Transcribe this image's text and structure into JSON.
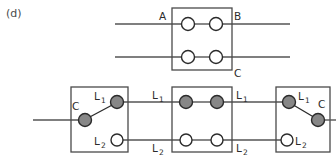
{
  "figure": {
    "caption": "(d)",
    "width": 336,
    "height": 156,
    "colors": {
      "background": "#ffffff",
      "wire": "#555555",
      "box_outline": "#4a4a4a",
      "terminal_filled": "#878787",
      "terminal_open": "#ffffff",
      "terminal_stroke": "#2b2b2b",
      "text": "#2b2b2b",
      "caption_text": "#4a4a4a"
    }
  },
  "top_assembly": {
    "name": "double-pole-switch",
    "box": {
      "x": 172,
      "y": 8,
      "width": 60,
      "height": 62
    },
    "labels": {
      "a": "A",
      "b": "B",
      "c": "C"
    },
    "rows": [
      {
        "name": "upper-pole",
        "y": 24,
        "left_wire_x1": 115,
        "right_wire_x2": 290,
        "terminals": [
          {
            "cx": 188,
            "cy": 24,
            "r": 6.5,
            "state": "open"
          },
          {
            "cx": 216,
            "cy": 24,
            "r": 6.5,
            "state": "open"
          }
        ]
      },
      {
        "name": "lower-pole",
        "y": 57,
        "left_wire_x1": 115,
        "right_wire_x2": 290,
        "terminals": [
          {
            "cx": 188,
            "cy": 57,
            "r": 6.5,
            "state": "open"
          },
          {
            "cx": 216,
            "cy": 57,
            "r": 6.5,
            "state": "open"
          }
        ]
      }
    ]
  },
  "bottom_assembly": {
    "name": "three-way-switch-chain",
    "rails": {
      "upper_label": "L1",
      "lower_label": "L2",
      "upper_y": 102,
      "lower_y": 140
    },
    "boxes": [
      {
        "name": "left-switch",
        "type": "three-way",
        "x": 71,
        "y": 87,
        "width": 57,
        "height": 65,
        "terminals": [
          {
            "name": "C",
            "cx": 85,
            "cy": 120,
            "r": 6.5,
            "state": "filled",
            "label": "C",
            "label_x": 77,
            "label_y": 106
          },
          {
            "name": "L1",
            "cx": 117,
            "cy": 102,
            "r": 6.5,
            "state": "filled",
            "label": "L1",
            "label_x": 97,
            "label_y": 101
          },
          {
            "name": "L2",
            "cx": 117,
            "cy": 140,
            "r": 6.0,
            "state": "open",
            "label": "L2",
            "label_x": 96,
            "label_y": 145
          }
        ],
        "blade": {
          "x1": 85,
          "y1": 120,
          "x2": 117,
          "y2": 102
        },
        "lead": {
          "x1": 33,
          "y1": 120,
          "x2": 71,
          "y2": 120
        }
      },
      {
        "name": "middle-switch",
        "type": "four-way",
        "x": 172,
        "y": 87,
        "width": 60,
        "height": 65,
        "terminals": [
          {
            "name": "L1-in",
            "cx": 186,
            "cy": 102,
            "r": 6.5,
            "state": "filled",
            "label": "L1",
            "label_x": 153,
            "label_y": 99
          },
          {
            "name": "L1-out",
            "cx": 217,
            "cy": 102,
            "r": 6.5,
            "state": "filled",
            "label": "L1",
            "label_x": 237,
            "label_y": 99
          },
          {
            "name": "L2-in",
            "cx": 186,
            "cy": 140,
            "r": 6.0,
            "state": "open",
            "label": "L2",
            "label_x": 153,
            "label_y": 151
          },
          {
            "name": "L2-out",
            "cx": 217,
            "cy": 140,
            "r": 6.0,
            "state": "open",
            "label": "L2",
            "label_x": 237,
            "label_y": 151
          }
        ]
      },
      {
        "name": "right-switch",
        "type": "three-way",
        "x": 276,
        "y": 87,
        "width": 54,
        "height": 65,
        "terminals": [
          {
            "name": "L1",
            "cx": 289,
            "cy": 102,
            "r": 6.5,
            "state": "filled",
            "label": "L1",
            "label_x": 299,
            "label_y": 101
          },
          {
            "name": "C",
            "cx": 318,
            "cy": 120,
            "r": 6.5,
            "state": "filled",
            "label": "C",
            "label_x": 320,
            "label_y": 105
          },
          {
            "name": "L2",
            "cx": 287,
            "cy": 140,
            "r": 6.0,
            "state": "open",
            "label": "L2",
            "label_x": 296,
            "label_y": 145
          }
        ],
        "blade": {
          "x1": 289,
          "y1": 102,
          "x2": 318,
          "y2": 120
        },
        "lead": {
          "x1": 318,
          "y1": 120,
          "x2": 336,
          "y2": 120
        }
      }
    ],
    "interconnects": [
      {
        "name": "upper-left-span",
        "x1": 117,
        "y1": 102,
        "x2": 186,
        "y2": 102
      },
      {
        "name": "upper-right-span",
        "x1": 217,
        "y1": 102,
        "x2": 289,
        "y2": 102
      },
      {
        "name": "lower-left-span",
        "x1": 117,
        "y1": 140,
        "x2": 186,
        "y2": 140
      },
      {
        "name": "lower-right-span",
        "x1": 217,
        "y1": 140,
        "x2": 287,
        "y2": 140
      }
    ]
  }
}
